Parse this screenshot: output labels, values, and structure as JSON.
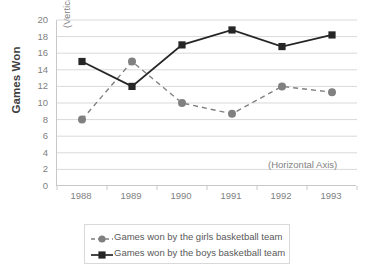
{
  "chart_data": {
    "type": "line",
    "title": "",
    "xlabel": "(Horizontal Axis)",
    "ylabel": "Games Won",
    "vertical_axis_note": "(Vertical Axis)",
    "horizontal_axis_note": "(Horizontal Axis)",
    "categories": [
      "1988",
      "1989",
      "1990",
      "1991",
      "1992",
      "1993"
    ],
    "ylim": [
      0,
      20
    ],
    "y_ticks": [
      "20",
      "18",
      "16",
      "14",
      "12",
      "10",
      "8",
      "6",
      "4",
      "2",
      "0"
    ],
    "grid": true,
    "legend_position": "bottom",
    "series": [
      {
        "name": "Games won by the girls basketball team",
        "values": [
          8,
          15,
          10,
          8.7,
          12,
          11.3
        ],
        "color": "#808080",
        "marker": "circle",
        "line_style": "dashed"
      },
      {
        "name": "Games won by the boys basketball team",
        "values": [
          15,
          12,
          17,
          18.8,
          16.8,
          18.2
        ],
        "color": "#262626",
        "marker": "square",
        "line_style": "solid"
      }
    ]
  },
  "legend": {
    "items": [
      {
        "label": "Games won by the girls basketball team"
      },
      {
        "label": "Games won by the boys basketball team"
      }
    ]
  }
}
